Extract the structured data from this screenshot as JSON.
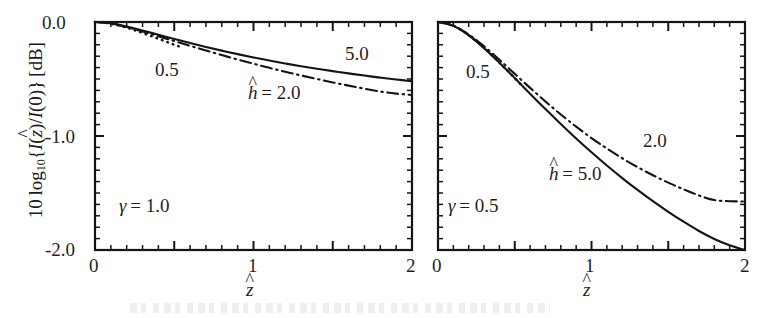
{
  "figure": {
    "background": "#ffffff",
    "ink": "#141414",
    "axis_title_x": "ẑ",
    "axis_title_y": "10 log₁₀{I(ẑ)/I(0)} [dB]",
    "y_tick_labels": [
      "0.0",
      "-1.0",
      "-2.0"
    ],
    "x_tick_labels": [
      "0",
      "1",
      "2"
    ]
  },
  "chart_data": [
    {
      "type": "line",
      "panel": "left",
      "title": "",
      "xlabel": "ẑ",
      "ylabel": "10 log₁₀{I(ẑ)/I(0)} [dB]",
      "xlim": [
        0,
        2
      ],
      "ylim": [
        -2.0,
        0.0
      ],
      "xticks": [
        0,
        0.5,
        1,
        1.5,
        2
      ],
      "xtick_labels": [
        "0",
        "",
        "1",
        "",
        "2"
      ],
      "yticks": [
        0.0,
        -1.0,
        -2.0
      ],
      "ytick_labels": [
        "0.0",
        "-1.0",
        "-2.0"
      ],
      "minor_tick_step_x": 0.1,
      "minor_tick_step_y": 0.1,
      "grid": false,
      "legend": "inline-annotations",
      "annotations": [
        {
          "text": "γ = 1.0",
          "x": 0.18,
          "y": -1.6
        },
        {
          "text": "0.5",
          "x": 0.4,
          "y": -0.3
        },
        {
          "text": "5.0",
          "x": 1.62,
          "y": -0.22
        },
        {
          "text": "ĥ = 2.0",
          "x": 1.1,
          "y": -0.55
        }
      ],
      "series": [
        {
          "name": "0.5",
          "label": "ĥ = 0.5",
          "style": "dotted",
          "x": [
            0.0,
            0.05,
            0.1,
            0.15,
            0.2,
            0.25,
            0.3,
            0.35,
            0.4,
            0.45,
            0.5,
            0.55
          ],
          "values": [
            0.0,
            -0.004,
            -0.015,
            -0.031,
            -0.05,
            -0.072,
            -0.096,
            -0.121,
            -0.147,
            -0.173,
            -0.199,
            -0.224
          ]
        },
        {
          "name": "2.0",
          "label": "ĥ = 2.0",
          "style": "dash-dot",
          "x": [
            0.0,
            0.1,
            0.2,
            0.3,
            0.4,
            0.5,
            0.6,
            0.7,
            0.8,
            0.9,
            1.0,
            1.1,
            1.2,
            1.3,
            1.4,
            1.5,
            1.6,
            1.7,
            1.8,
            1.9,
            2.0
          ],
          "values": [
            0.0,
            -0.013,
            -0.044,
            -0.083,
            -0.125,
            -0.167,
            -0.209,
            -0.25,
            -0.29,
            -0.329,
            -0.366,
            -0.402,
            -0.436,
            -0.469,
            -0.5,
            -0.53,
            -0.558,
            -0.585,
            -0.61,
            -0.628,
            -0.64
          ]
        },
        {
          "name": "5.0",
          "label": "ĥ = 5.0",
          "style": "solid",
          "x": [
            0.0,
            0.1,
            0.2,
            0.3,
            0.4,
            0.5,
            0.6,
            0.7,
            0.8,
            0.9,
            1.0,
            1.1,
            1.2,
            1.3,
            1.4,
            1.5,
            1.6,
            1.7,
            1.8,
            1.9,
            2.0
          ],
          "values": [
            0.0,
            -0.012,
            -0.04,
            -0.075,
            -0.112,
            -0.149,
            -0.185,
            -0.219,
            -0.251,
            -0.282,
            -0.311,
            -0.338,
            -0.364,
            -0.388,
            -0.41,
            -0.431,
            -0.451,
            -0.47,
            -0.488,
            -0.504,
            -0.52
          ]
        }
      ]
    },
    {
      "type": "line",
      "panel": "right",
      "title": "",
      "xlabel": "ẑ",
      "ylabel": "",
      "xlim": [
        0,
        2
      ],
      "ylim": [
        -2.0,
        0.0
      ],
      "xticks": [
        0,
        0.5,
        1,
        1.5,
        2
      ],
      "xtick_labels": [
        "0",
        "",
        "1",
        "",
        "2"
      ],
      "yticks": [
        0.0,
        -1.0,
        -2.0
      ],
      "ytick_labels": [
        "",
        "",
        ""
      ],
      "minor_tick_step_x": 0.1,
      "minor_tick_step_y": 0.1,
      "grid": false,
      "legend": "inline-annotations",
      "annotations": [
        {
          "text": "γ = 0.5",
          "x": 0.1,
          "y": -1.58
        },
        {
          "text": "0.5",
          "x": 0.23,
          "y": -0.32
        },
        {
          "text": "2.0",
          "x": 1.32,
          "y": -1.02
        },
        {
          "text": "ĥ = 5.0",
          "x": 0.72,
          "y": -1.3
        }
      ],
      "series": [
        {
          "name": "0.5",
          "label": "ĥ = 0.5",
          "style": "dotted",
          "x": [
            0.0,
            0.05,
            0.1,
            0.15,
            0.2,
            0.25,
            0.3,
            0.35,
            0.4,
            0.45,
            0.5,
            0.55
          ],
          "values": [
            0.0,
            -0.009,
            -0.033,
            -0.069,
            -0.115,
            -0.168,
            -0.226,
            -0.289,
            -0.355,
            -0.423,
            -0.492,
            -0.562
          ]
        },
        {
          "name": "2.0",
          "label": "ĥ = 2.0",
          "style": "dash-dot",
          "x": [
            0.0,
            0.1,
            0.2,
            0.3,
            0.4,
            0.5,
            0.6,
            0.7,
            0.8,
            0.9,
            1.0,
            1.1,
            1.2,
            1.3,
            1.4,
            1.5,
            1.6,
            1.7,
            1.8,
            1.9,
            2.0
          ],
          "values": [
            0.0,
            -0.032,
            -0.109,
            -0.213,
            -0.331,
            -0.455,
            -0.578,
            -0.697,
            -0.811,
            -0.918,
            -1.018,
            -1.11,
            -1.195,
            -1.273,
            -1.344,
            -1.409,
            -1.468,
            -1.521,
            -1.562,
            -1.572,
            -1.575
          ]
        },
        {
          "name": "5.0",
          "label": "ĥ = 5.0",
          "style": "solid",
          "x": [
            0.0,
            0.1,
            0.2,
            0.3,
            0.4,
            0.5,
            0.6,
            0.7,
            0.8,
            0.9,
            1.0,
            1.1,
            1.2,
            1.3,
            1.4,
            1.5,
            1.6,
            1.7,
            1.8,
            1.9,
            2.0
          ],
          "values": [
            0.0,
            -0.034,
            -0.117,
            -0.229,
            -0.357,
            -0.492,
            -0.629,
            -0.764,
            -0.895,
            -1.022,
            -1.143,
            -1.259,
            -1.369,
            -1.473,
            -1.572,
            -1.665,
            -1.752,
            -1.833,
            -1.903,
            -1.959,
            -2.0
          ]
        }
      ]
    }
  ],
  "left_panel": {
    "gamma_label": "γ = 1.0",
    "label_05": "0.5",
    "label_50": "5.0",
    "label_h20": "ĥ = 2.0",
    "x_tick_0": "0",
    "x_tick_1": "1",
    "x_tick_2": "2",
    "y_tick_0": "0.0",
    "y_tick_1": "-1.0",
    "y_tick_2": "-2.0",
    "x_axis_title": "ẑ"
  },
  "right_panel": {
    "gamma_label": "γ = 0.5",
    "label_05": "0.5",
    "label_20": "2.0",
    "label_h50": "ĥ = 5.0",
    "x_tick_0": "0",
    "x_tick_1": "1",
    "x_tick_2": "2",
    "x_axis_title": "ẑ"
  }
}
